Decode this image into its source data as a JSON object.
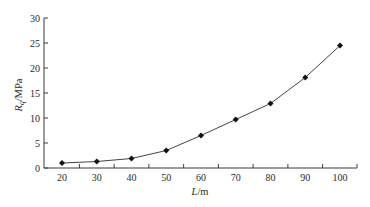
{
  "chart_data": {
    "type": "line",
    "title": "",
    "xlabel": "L/m",
    "xlabel_main": "L",
    "xlabel_unit": "/m",
    "ylabel": "R_q/MPa",
    "ylabel_main": "R",
    "ylabel_sub": "q",
    "ylabel_unit": "/MPa",
    "x": [
      20,
      30,
      40,
      50,
      60,
      70,
      80,
      90,
      100
    ],
    "series": [
      {
        "name": "R_q",
        "values": [
          1.0,
          1.3,
          1.9,
          3.5,
          6.5,
          9.7,
          12.9,
          18.1,
          24.5
        ],
        "marker": "diamond",
        "color": "#111111"
      }
    ],
    "xticks": [
      "20",
      "30",
      "40",
      "50",
      "60",
      "70",
      "80",
      "90",
      "100"
    ],
    "yticks": [
      "0",
      "5",
      "10",
      "15",
      "20",
      "25",
      "30"
    ],
    "ylim": [
      0,
      30
    ],
    "grid": false,
    "legend": null
  }
}
